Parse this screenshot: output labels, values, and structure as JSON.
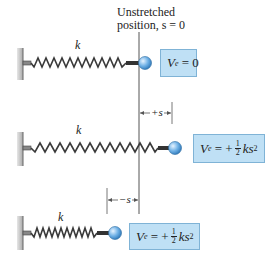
{
  "diagram": {
    "title_line1": "Unstretched",
    "title_line2": "position, s = 0",
    "colors": {
      "spring": "#3a3a3a",
      "ball": "#6fb1e6",
      "box_fill": "#bfe0f5",
      "box_border": "#7fb3d6",
      "wall": "#c8c8c8",
      "reference_line": "#555555"
    },
    "springs": [
      {
        "id": "unstretched",
        "k_label": "k",
        "energy": {
          "V": "V",
          "sub": "e",
          "rhs": "= 0"
        }
      },
      {
        "id": "stretched",
        "k_label": "k",
        "displacement_label": "+s",
        "energy": {
          "V": "V",
          "sub": "e",
          "eq": "= +",
          "num": "1",
          "den": "2",
          "ks": "ks",
          "exp": "2"
        }
      },
      {
        "id": "compressed",
        "k_label": "k",
        "displacement_label": "−s",
        "energy": {
          "V": "V",
          "sub": "e",
          "eq": "= +",
          "num": "1",
          "den": "2",
          "ks": "ks",
          "exp": "2"
        }
      }
    ]
  }
}
